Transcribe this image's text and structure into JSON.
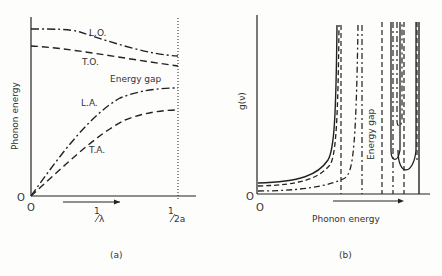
{
  "panel_a": {
    "caption": "(a)",
    "ylabel": "Phonon energy",
    "origin_y": "O",
    "origin_x": "O",
    "x_arrow_label_num": "1",
    "x_arrow_label_den": "λ",
    "x_end_label_num": "1",
    "x_end_label_den": "2a",
    "curves": {
      "lo": "L.O.",
      "to": "T.O.",
      "la": "L.A.",
      "ta": "T.A."
    },
    "gap_label": "Energy gap"
  },
  "panel_b": {
    "caption": "(b)",
    "ylabel": "g(ν)",
    "origin_y": "O",
    "origin_x": "O",
    "xlabel": "Phonon energy",
    "gap_label": "Energy gap"
  }
}
